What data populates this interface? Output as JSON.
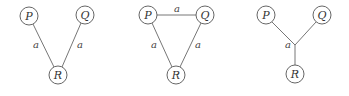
{
  "diagrams": [
    {
      "name": "v-shape",
      "nodes": [
        {
          "id": "P",
          "label": "P",
          "x": 29,
          "y": 16
        },
        {
          "id": "Q",
          "label": "Q",
          "x": 85,
          "y": 15
        },
        {
          "id": "R",
          "label": "R",
          "x": 58,
          "y": 75
        }
      ],
      "edges": [
        {
          "from": "P",
          "to": "R",
          "label": "a"
        },
        {
          "from": "Q",
          "to": "R",
          "label": "a"
        }
      ]
    },
    {
      "name": "triangle",
      "nodes": [
        {
          "id": "P",
          "label": "P",
          "x": 148,
          "y": 15
        },
        {
          "id": "Q",
          "label": "Q",
          "x": 205,
          "y": 15
        },
        {
          "id": "R",
          "label": "R",
          "x": 176,
          "y": 75
        }
      ],
      "edges": [
        {
          "from": "P",
          "to": "Q",
          "label": "a"
        },
        {
          "from": "P",
          "to": "R",
          "label": "a"
        },
        {
          "from": "Q",
          "to": "R",
          "label": "a"
        }
      ]
    },
    {
      "name": "y-shape",
      "nodes": [
        {
          "id": "P",
          "label": "P",
          "x": 266,
          "y": 15
        },
        {
          "id": "Q",
          "label": "Q",
          "x": 322,
          "y": 15
        },
        {
          "id": "R",
          "label": "R",
          "x": 295,
          "y": 74
        }
      ],
      "junction": {
        "x": 295,
        "y": 45,
        "label": "a"
      },
      "edges": [
        {
          "from": "P",
          "to": "junction"
        },
        {
          "from": "Q",
          "to": "junction"
        },
        {
          "from": "junction",
          "to": "R"
        }
      ]
    }
  ]
}
